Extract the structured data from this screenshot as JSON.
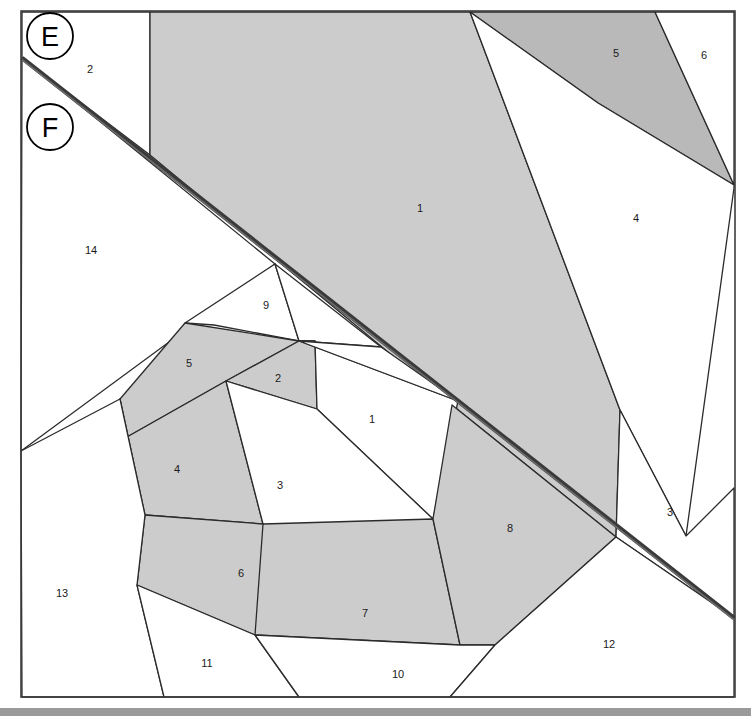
{
  "figure": {
    "canvas": {
      "width": 751,
      "height": 716
    },
    "frame": {
      "x": 21,
      "y": 11,
      "width": 714,
      "height": 686
    },
    "colors": {
      "background": "#ffffff",
      "fill_light": "#ffffff",
      "fill_gray": "#cccccc",
      "fill_gray_dark": "#b9b9b9",
      "stroke": "#2b2b2b",
      "frame_stroke": "#3c3c3c",
      "cut_line": "#3a3a3a",
      "footer_bar": "#9a9a9a",
      "label_text": "#1a1a1a"
    }
  },
  "callouts": [
    {
      "id": "callout-e",
      "label": "E",
      "cx": 50,
      "cy": 36,
      "r": 23
    },
    {
      "id": "callout-f",
      "label": "F",
      "cx": 50,
      "cy": 127,
      "r": 23
    }
  ],
  "cut_line": {
    "name": "thick-diagonal-cut",
    "x1": 22,
    "y1": 58,
    "x2": 734,
    "y2": 618
  },
  "regions": [
    {
      "id": "r-upper-2",
      "label": "2",
      "shade": "light",
      "label_x": 90,
      "label_y": 70,
      "points": "22,12 150,12 150,155 22,58"
    },
    {
      "id": "r-upper-1",
      "label": "1",
      "shade": "gray",
      "label_x": 420,
      "label_y": 209,
      "points": "150,12 470,12 620,410 616,537 452,405 150,155"
    },
    {
      "id": "r-upper-5",
      "label": "5",
      "shade": "gray-dark",
      "label_x": 616,
      "label_y": 54,
      "points": "470,12 655,12 734,185 598,103"
    },
    {
      "id": "r-upper-6",
      "label": "6",
      "shade": "light",
      "label_x": 704,
      "label_y": 56,
      "points": "655,12 734,12 734,185"
    },
    {
      "id": "r-right-4",
      "label": "4",
      "shade": "light",
      "label_x": 636,
      "label_y": 219,
      "points": "470,12 598,103 734,185 734,188 686,536 620,410"
    },
    {
      "id": "r-right-3",
      "label": "3",
      "shade": "light",
      "label_x": 670,
      "label_y": 513,
      "points": "620,410 686,536 734,488 734,618 616,537"
    },
    {
      "id": "r-left-14",
      "label": "14",
      "shade": "light",
      "label_x": 91,
      "label_y": 251,
      "points": "22,58 275,264 21,451"
    },
    {
      "id": "r-mid-9",
      "label": "9",
      "shade": "light",
      "label_x": 266,
      "label_y": 306,
      "points": "275,264 299,341 214,325 185,323"
    },
    {
      "id": "r-mid-9b",
      "label": "",
      "shade": "light",
      "label_x": 0,
      "label_y": 0,
      "points": "275,264 381,347 299,341"
    },
    {
      "id": "r-spiral-5",
      "label": "5",
      "shade": "gray",
      "label_x": 189,
      "label_y": 364,
      "points": "185,323 299,341 226,381 127,437 120,399"
    },
    {
      "id": "r-spiral-2",
      "label": "2",
      "shade": "gray",
      "label_x": 278,
      "label_y": 379,
      "points": "299,341 315,341 317,409 226,381"
    },
    {
      "id": "r-inner-1",
      "label": "1",
      "shade": "light",
      "label_x": 372,
      "label_y": 420,
      "points": "299,341 458,401 433,519 317,409 315,341"
    },
    {
      "id": "r-inner-9tri",
      "label": "",
      "shade": "light",
      "label_x": 0,
      "label_y": 0,
      "points": "299,341 381,347 458,401"
    },
    {
      "id": "r-spiral-4",
      "label": "4",
      "shade": "gray",
      "label_x": 177,
      "label_y": 470,
      "points": "120,399 127,437 226,381 263,524 145,515"
    },
    {
      "id": "r-inner-3",
      "label": "3",
      "shade": "light",
      "label_x": 280,
      "label_y": 486,
      "points": "226,381 317,409 433,519 364,576 263,524"
    },
    {
      "id": "r-spiral-6",
      "label": "6",
      "shade": "gray",
      "label_x": 241,
      "label_y": 574,
      "points": "145,515 263,524 364,576 255,635 137,585"
    },
    {
      "id": "r-spiral-7",
      "label": "7",
      "shade": "gray",
      "label_x": 365,
      "label_y": 614,
      "points": "263,524 433,519 460,645 255,635"
    },
    {
      "id": "r-lower-8",
      "label": "8",
      "shade": "gray",
      "label_x": 510,
      "label_y": 529,
      "points": "433,519 452,405 616,537 495,645 460,645"
    },
    {
      "id": "r-lower-13",
      "label": "13",
      "shade": "light",
      "label_x": 62,
      "label_y": 594,
      "points": "21,451 120,399 145,515 137,585 164,697 22,697"
    },
    {
      "id": "r-lower-11",
      "label": "11",
      "shade": "light",
      "label_x": 207,
      "label_y": 664,
      "points": "137,585 255,635 299,697 164,697"
    },
    {
      "id": "r-lower-10",
      "label": "10",
      "shade": "light",
      "label_x": 398,
      "label_y": 675,
      "points": "255,635 460,645 495,645 450,697 299,697"
    },
    {
      "id": "r-lower-12",
      "label": "12",
      "shade": "light",
      "label_x": 609,
      "label_y": 645,
      "points": "495,645 616,537 734,618 734,697 450,697"
    }
  ],
  "footer": {
    "name": "bottom-gray-bar",
    "y": 708,
    "height": 8,
    "color": "#9a9a9a"
  }
}
